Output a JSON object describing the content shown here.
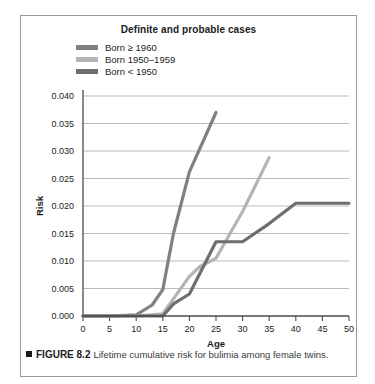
{
  "figure": {
    "title": "Definite and probable cases",
    "caption_marker": "■",
    "caption_label": "FIGURE 8.2",
    "caption_text": "Lifetime cumulative risk for bulimia among female twins."
  },
  "legend": {
    "position": "top-left-inside",
    "items": [
      {
        "label": "Born ≥ 1960",
        "color": "#808080"
      },
      {
        "label": "Born 1950–1959",
        "color": "#b4b4b4"
      },
      {
        "label": "Born < 1950",
        "color": "#6e6e6e"
      }
    ]
  },
  "chart_data": {
    "type": "line",
    "title": "Definite and probable cases",
    "xlabel": "Age",
    "ylabel": "Risk",
    "xlim": [
      0,
      50
    ],
    "ylim": [
      0.0,
      0.04
    ],
    "grid": "horizontal",
    "xticks": [
      0,
      5,
      10,
      15,
      20,
      25,
      30,
      35,
      40,
      45,
      50
    ],
    "xtick_labels": [
      "0",
      "5",
      "10",
      "15",
      "20",
      "25",
      "30",
      "35",
      "40",
      "45",
      "50"
    ],
    "yticks": [
      0.0,
      0.005,
      0.01,
      0.015,
      0.02,
      0.025,
      0.03,
      0.035,
      0.04
    ],
    "ytick_labels": [
      "0.000",
      "0.005",
      "0.010",
      "0.015",
      "0.020",
      "0.025",
      "0.030",
      "0.035",
      "0.040"
    ],
    "series": [
      {
        "name": "Born ≥ 1960",
        "color": "#808080",
        "x": [
          0,
          5,
          10,
          13,
          15,
          17,
          20,
          25
        ],
        "y": [
          0.0,
          0.0,
          0.0002,
          0.002,
          0.0048,
          0.015,
          0.0262,
          0.037
        ]
      },
      {
        "name": "Born 1950–1959",
        "color": "#b4b4b4",
        "x": [
          0,
          5,
          10,
          15,
          20,
          22,
          25,
          30,
          35
        ],
        "y": [
          0.0,
          0.0,
          0.0,
          0.0004,
          0.0072,
          0.009,
          0.0105,
          0.019,
          0.0288
        ]
      },
      {
        "name": "Born < 1950",
        "color": "#6e6e6e",
        "x": [
          0,
          5,
          10,
          15,
          17,
          20,
          25,
          30,
          35,
          40,
          45,
          50
        ],
        "y": [
          0.0,
          0.0,
          0.0,
          0.0,
          0.0022,
          0.004,
          0.0135,
          0.0135,
          0.0168,
          0.0205,
          0.0205,
          0.0205
        ]
      }
    ]
  },
  "style": {
    "grid_color": "#9e9e9e",
    "axis_color": "#4a4a4a",
    "frame_color": "#9a9a9a",
    "text_color": "#1b1b1b",
    "background": "#ffffff"
  }
}
